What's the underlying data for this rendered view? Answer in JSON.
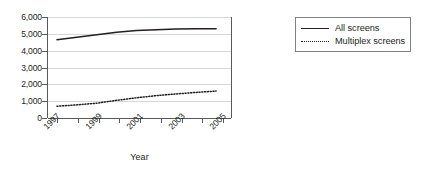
{
  "chart_data": {
    "type": "line",
    "title": "",
    "xlabel": "Year",
    "ylabel": "",
    "x": [
      1997,
      1998,
      1999,
      2000,
      2001,
      2002,
      2003,
      2004,
      2005
    ],
    "xtick_labels": [
      "1997",
      "1999",
      "2001",
      "2003",
      "2005"
    ],
    "xtick_values": [
      1997,
      1999,
      2001,
      2003,
      2005
    ],
    "xlim": [
      1996.5,
      2005.8
    ],
    "ytick_labels": [
      "0",
      "1,000",
      "2,000",
      "3,000",
      "4,000",
      "5,000",
      "6,000"
    ],
    "ytick_values": [
      0,
      1000,
      2000,
      3000,
      4000,
      5000,
      6000
    ],
    "ylim": [
      0,
      6000
    ],
    "grid": "horizontal",
    "legend_position": "right",
    "series": [
      {
        "name": "All screens",
        "style": "solid",
        "color": "#231f20",
        "values": [
          4650,
          4800,
          4950,
          5100,
          5200,
          5250,
          5280,
          5300,
          5300
        ]
      },
      {
        "name": "Multiplex screens",
        "style": "dotted",
        "color": "#231f20",
        "values": [
          700,
          780,
          880,
          1050,
          1200,
          1330,
          1430,
          1520,
          1600
        ]
      }
    ]
  },
  "legend": {
    "items": [
      {
        "label": "All screens",
        "style": "solid"
      },
      {
        "label": "Multiplex screens",
        "style": "dotted"
      }
    ]
  },
  "axes": {
    "x_title": "Year"
  },
  "colors": {
    "ink": "#231f20",
    "axis": "#58595b",
    "grid": "#d6d7d8",
    "background": "#ffffff"
  }
}
